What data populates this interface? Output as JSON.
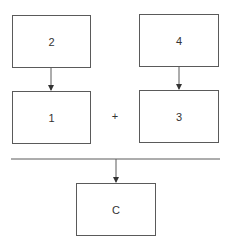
{
  "diagram": {
    "boxes": {
      "top_left": {
        "label": "2"
      },
      "top_right": {
        "label": "4"
      },
      "mid_left": {
        "label": "1"
      },
      "mid_right": {
        "label": "3"
      },
      "bottom": {
        "label": "C"
      }
    },
    "operator": "+",
    "colors": {
      "line": "#5a5a5a",
      "text": "#333333",
      "background": "#ffffff"
    }
  }
}
